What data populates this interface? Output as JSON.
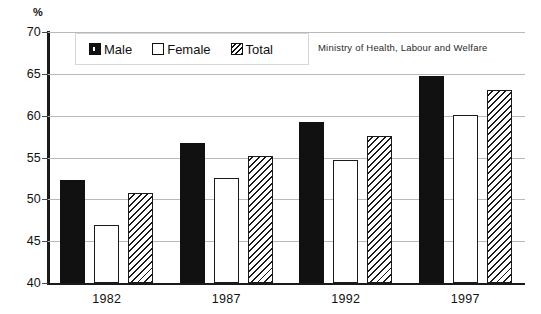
{
  "chart_data": {
    "type": "bar",
    "title": "",
    "subtitle": "",
    "xlabel": "",
    "ylabel": "%",
    "unit_label": "%",
    "categories": [
      "1982",
      "1987",
      "1992",
      "1997"
    ],
    "series": [
      {
        "name": "Male",
        "values": [
          52.3,
          56.7,
          59.2,
          64.8
        ],
        "style": "solid-black",
        "color": "#111111"
      },
      {
        "name": "Female",
        "values": [
          46.9,
          52.5,
          54.7,
          60.1
        ],
        "style": "open-white",
        "color": "#ffffff"
      },
      {
        "name": "Total",
        "values": [
          50.7,
          55.2,
          57.6,
          63.1
        ],
        "style": "diagonal-hatch",
        "color": "#ffffff"
      }
    ],
    "ylim": [
      40,
      70
    ],
    "yticks": [
      40,
      45,
      50,
      55,
      60,
      65,
      70
    ],
    "ytick_labels": [
      "40",
      "45",
      "50",
      "55",
      "60",
      "65",
      "70"
    ],
    "grid": true,
    "grid_color": "#b9b9b9",
    "legend_position": "top-left",
    "annotations": [
      "Ministry of Health, Labour and Welfare"
    ]
  },
  "legend": {
    "entries": [
      {
        "label": "Male"
      },
      {
        "label": "Female"
      },
      {
        "label": "Total"
      }
    ]
  },
  "attribution": {
    "text": "Ministry of Health, Labour and Welfare"
  }
}
